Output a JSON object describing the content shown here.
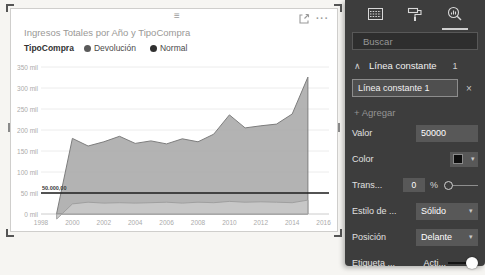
{
  "visual": {
    "title": "Ingresos Totales por Año y TipoCompra",
    "legend": {
      "title": "TipoCompra",
      "items": [
        {
          "label": "Devolución",
          "color": "#5a5a5a"
        },
        {
          "label": "Normal",
          "color": "#303030"
        }
      ]
    },
    "header": {
      "more_glyph": "···"
    }
  },
  "chart_data": {
    "type": "area",
    "title": "Ingresos Totales por Año y TipoCompra",
    "x_years": [
      1999,
      2000,
      2001,
      2002,
      2003,
      2004,
      2005,
      2006,
      2007,
      2008,
      2009,
      2010,
      2011,
      2012,
      2013,
      2014,
      2015
    ],
    "series": [
      {
        "name": "Normal",
        "values_mil": [
          2,
          180,
          162,
          172,
          185,
          168,
          174,
          167,
          179,
          172,
          190,
          236,
          205,
          210,
          214,
          238,
          326
        ],
        "fill": "#a9a9a9",
        "stroke": "#7d7d7d"
      },
      {
        "name": "Devolución",
        "values_mil": [
          -12,
          24,
          28,
          26,
          27,
          26,
          27,
          28,
          26,
          28,
          27,
          30,
          28,
          29,
          28,
          27,
          33
        ],
        "fill": "#c9c9c9",
        "stroke": "#9f9f9f"
      }
    ],
    "y_tick_values_mil": [
      350,
      300,
      250,
      200,
      150,
      100,
      50,
      0
    ],
    "y_tick_labels": [
      "350 mil",
      "300 mil",
      "250 mil",
      "200 mil",
      "150 mil",
      "100 mil",
      "50 mil",
      "0 mil"
    ],
    "x_ticks": [
      1998,
      2000,
      2002,
      2004,
      2006,
      2008,
      2010,
      2012,
      2014,
      2016
    ],
    "ylim_mil": [
      0,
      350
    ],
    "grid": "horizontal",
    "legend_position": "top",
    "constant_line": {
      "value": 50000,
      "value_mil": 50,
      "label": "50.000,00",
      "color": "#1c1c1c",
      "style": "Sólido",
      "position": "Delante"
    }
  },
  "panel": {
    "tabs": [
      {
        "name": "fields-grid",
        "selected": false
      },
      {
        "name": "format-paint-roller",
        "selected": false
      },
      {
        "name": "analytics-magnifier",
        "selected": true
      }
    ],
    "search": {
      "placeholder": "Buscar"
    },
    "section": {
      "collapse_glyph": "∧",
      "title": "Línea constante",
      "count": "1"
    },
    "card": {
      "title": "Línea constante 1",
      "remove_glyph": "×"
    },
    "add": {
      "label": "+ Agregar"
    },
    "rows": {
      "valor": {
        "label": "Valor",
        "value": "50000"
      },
      "color": {
        "label": "Color",
        "swatch": "#0d0d0d",
        "caret": "▾"
      },
      "transparencia": {
        "label": "Trans...",
        "value": "0",
        "unit": "%"
      },
      "estilo": {
        "label": "Estilo de ...",
        "value": "Sólido",
        "caret": "▾"
      },
      "posicion": {
        "label": "Posición",
        "value": "Delante",
        "caret": "▾"
      },
      "etiqueta": {
        "label": "Etiqueta ...",
        "value": "Acti..."
      }
    }
  }
}
